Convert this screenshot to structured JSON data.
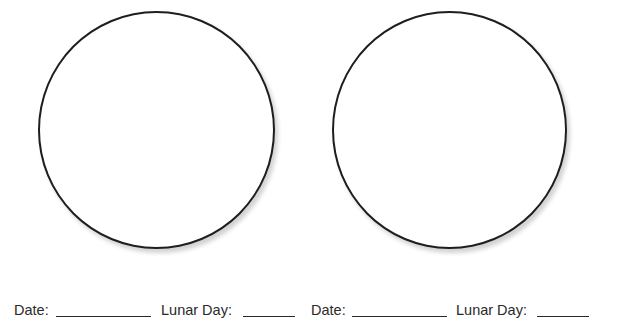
{
  "worksheet": {
    "observations": [
      {
        "circle": "moon-drawing-circle",
        "date_label": "Date:",
        "date_value": "",
        "lunar_day_label": "Lunar Day:",
        "lunar_day_value": ""
      },
      {
        "circle": "moon-drawing-circle",
        "date_label": "Date:",
        "date_value": "",
        "lunar_day_label": "Lunar Day:",
        "lunar_day_value": ""
      }
    ]
  }
}
